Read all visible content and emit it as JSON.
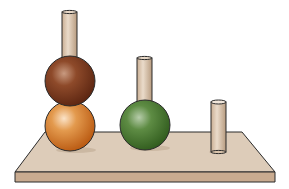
{
  "figure": {
    "colors": {
      "background": "#ffffff",
      "board_top": "#dcc9b4",
      "board_front": "#c7a88c",
      "outline": "#2a2a2a",
      "peg": "#d9c3ab",
      "ball_brown": "#7a3a1c",
      "ball_orange": "#d97a25",
      "ball_green": "#4f7d34"
    },
    "pegs": [
      {
        "id": "peg-1",
        "capacity": 3,
        "balls": [
          "brown",
          "orange"
        ]
      },
      {
        "id": "peg-2",
        "capacity": 2,
        "balls": [
          "green"
        ]
      },
      {
        "id": "peg-3",
        "capacity": 1,
        "balls": []
      }
    ]
  }
}
